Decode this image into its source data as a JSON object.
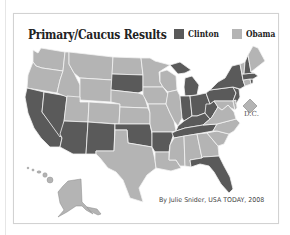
{
  "title": "Primary/Caucus Results",
  "legend": [
    {
      "label": "Clinton",
      "color": "#5a5a5a"
    },
    {
      "label": "Obama",
      "color": "#b4b4b4"
    }
  ],
  "colors": {
    "clinton": "#5a5a5a",
    "obama": "#b4b4b4",
    "border": "#f2f2f2"
  },
  "dc_label": "D.C.",
  "credit": "By Julie Snider, USA TODAY, 2008",
  "states": {
    "clinton": [
      "CA",
      "NV",
      "AZ",
      "NM",
      "OK",
      "AR",
      "TN",
      "KY",
      "WV",
      "OH",
      "IN",
      "MI",
      "PA",
      "NY",
      "NJ",
      "MA",
      "RI",
      "NH",
      "SD",
      "FL"
    ],
    "obama": [
      "WA",
      "OR",
      "ID",
      "MT",
      "WY",
      "UT",
      "CO",
      "ND",
      "NE",
      "KS",
      "MN",
      "IA",
      "MO",
      "WI",
      "IL",
      "TX",
      "LA",
      "MS",
      "AL",
      "GA",
      "SC",
      "NC",
      "VA",
      "MD",
      "DE",
      "CT",
      "VT",
      "ME",
      "AK",
      "HI",
      "DC"
    ]
  }
}
